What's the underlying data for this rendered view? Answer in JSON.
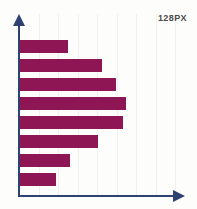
{
  "annotation": {
    "size_label": "128PX"
  },
  "colors": {
    "bar": "#8e1655",
    "axis": "#2e4272",
    "gridline": "#f1f0ee",
    "background": "#fdfdfc",
    "label_text": "#4a4a4a"
  },
  "chart_data": {
    "type": "bar",
    "orientation": "horizontal",
    "title": "",
    "subtitle": "",
    "xlabel": "",
    "ylabel": "",
    "categories": [
      "1",
      "2",
      "3",
      "4",
      "5",
      "6",
      "7",
      "8"
    ],
    "values": [
      46,
      78,
      91,
      101,
      98,
      74,
      48,
      35
    ],
    "xlim": [
      0,
      160
    ],
    "ylim": [
      0,
      8
    ],
    "grid": "vertical-faint",
    "legend": "none",
    "tick_labels_x": [],
    "tick_labels_y": [],
    "annotations": [
      "128PX"
    ],
    "series": [
      {
        "name": "series-1",
        "values": [
          46,
          78,
          91,
          101,
          98,
          74,
          48,
          35
        ]
      }
    ]
  }
}
